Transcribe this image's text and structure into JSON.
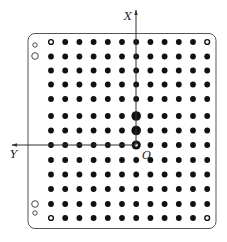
{
  "diagram": {
    "type": "hole-grid-board",
    "axes": {
      "x_label": "X",
      "y_label": "Y",
      "origin_label": "O"
    },
    "grid": {
      "columns": 12,
      "rows": 13,
      "origin_col": 6,
      "origin_row": 7
    },
    "special_points": {
      "corner_rings": [
        {
          "col": 0,
          "row": 0
        },
        {
          "col": 11,
          "row": 0
        },
        {
          "col": 0,
          "row": 12
        },
        {
          "col": 11,
          "row": 12
        }
      ],
      "large_dots": [
        {
          "col": 6,
          "row": 5
        },
        {
          "col": 6,
          "row": 6
        }
      ],
      "origin_ring": {
        "col": 6,
        "row": 7
      }
    },
    "edge_holes": {
      "top_left": [
        "small-hollow",
        "large-hollow"
      ],
      "bottom_left": [
        "large-hollow",
        "small-hollow"
      ]
    },
    "colors": {
      "dot": "#111111",
      "border": "#555555",
      "axis": "#333333",
      "background": "#ffffff"
    }
  }
}
